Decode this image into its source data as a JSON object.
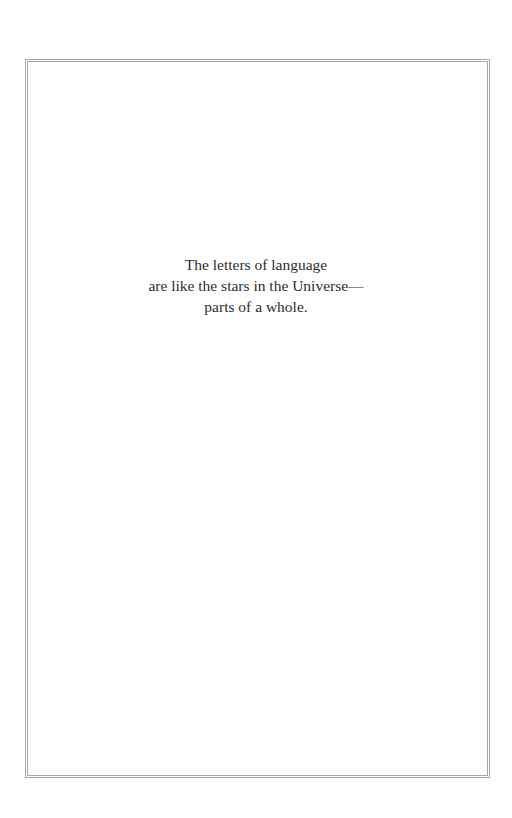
{
  "epigraph": {
    "lines": [
      "The letters of language",
      "are like the stars in the Universe—",
      "parts of a whole."
    ]
  }
}
